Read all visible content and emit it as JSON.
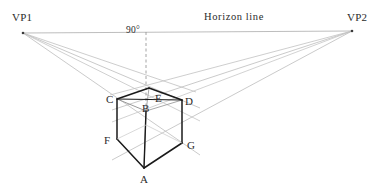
{
  "diagram": {
    "horizon_label": "Horizon line",
    "angle_label": "90°",
    "vanishing_points": [
      {
        "name": "VP1",
        "label": "VP1",
        "x": 23,
        "y": 33
      },
      {
        "name": "VP2",
        "label": "VP2",
        "x": 352,
        "y": 31
      }
    ],
    "vertices": [
      {
        "name": "A",
        "label": "A",
        "x": 144,
        "y": 168,
        "role": "bottom-front"
      },
      {
        "name": "B",
        "label": "B",
        "x": 146,
        "y": 111,
        "role": "top-front"
      },
      {
        "name": "C",
        "label": "C",
        "x": 117,
        "y": 99,
        "role": "top-left"
      },
      {
        "name": "D",
        "label": "D",
        "x": 182,
        "y": 100,
        "role": "top-right"
      },
      {
        "name": "E",
        "label": "E",
        "x": 149,
        "y": 88,
        "role": "top-back"
      },
      {
        "name": "F",
        "label": "F",
        "x": 117,
        "y": 139,
        "role": "bottom-left"
      },
      {
        "name": "G",
        "label": "G",
        "x": 182,
        "y": 143,
        "role": "bottom-right"
      }
    ],
    "labels": {
      "A": "A",
      "B": "B",
      "C": "C",
      "D": "D",
      "E": "E",
      "F": "F",
      "G": "G"
    },
    "colors": {
      "cube_stroke": "#1a1a1a",
      "hidden_stroke": "#8a8a8a",
      "construction_stroke": "#bdbdbd",
      "horizon_stroke": "#b5b5b5",
      "dashed_stroke": "#9a9a9a",
      "text": "#2b2b2b",
      "background": "#ffffff"
    },
    "geometry": {
      "horizon_y": 32,
      "vertical_dashed_x": 146,
      "vertical_dashed_top": 32,
      "vertical_dashed_bottom": 100
    }
  }
}
